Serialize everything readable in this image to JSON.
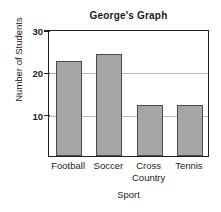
{
  "chart_data": {
    "type": "bar",
    "title": "George's Graph",
    "xlabel": "Sport",
    "ylabel": "Number of Students",
    "categories": [
      "Football",
      "Soccer",
      "Cross\nCountry",
      "Tennis"
    ],
    "values": [
      22.5,
      24,
      12,
      12
    ],
    "ylim": [
      0,
      30
    ],
    "yticks": [
      10,
      20,
      30
    ],
    "ytick_labels": [
      "10",
      "20",
      "30"
    ],
    "grid": true,
    "legend": "none",
    "bar_color": "#a5a5a5",
    "bar_edge_color": "#4a4a4a",
    "axis_color": "#222222",
    "grid_color": "#b9b9b9",
    "background": "#ffffff"
  }
}
